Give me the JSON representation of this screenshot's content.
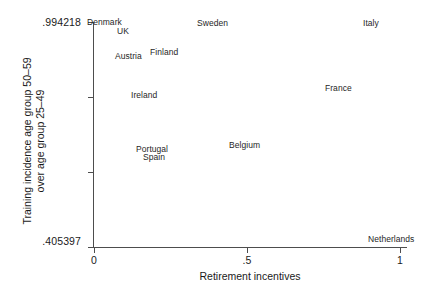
{
  "chart_data": {
    "type": "scatter",
    "title": "",
    "xlabel": "Retirement incentives",
    "ylabel_lines": [
      "Training incidence age group 50–59",
      "over age group 25–49"
    ],
    "xlim": [
      0,
      1
    ],
    "ylim": [
      0.405397,
      0.994218
    ],
    "xticks": [
      "0",
      ".5",
      "1"
    ],
    "xtick_values": [
      0,
      0.5,
      1
    ],
    "yticks": [
      ".994218",
      ".405397"
    ],
    "ytick_values": [
      0.994218,
      0.405397
    ],
    "grid": false,
    "legend": "none",
    "marker_style": "text-label-only",
    "points": [
      {
        "label": "Denmark",
        "x": 0.0,
        "y": 0.994,
        "px": 87,
        "py": 18
      },
      {
        "label": "UK",
        "x": 0.08,
        "y": 0.969,
        "px": 117,
        "py": 27
      },
      {
        "label": "Sweden",
        "x": 0.36,
        "y": 0.991,
        "px": 197,
        "py": 19
      },
      {
        "label": "Italy",
        "x": 0.88,
        "y": 0.991,
        "px": 363,
        "py": 19
      },
      {
        "label": "Austria",
        "x": 0.08,
        "y": 0.901,
        "px": 115,
        "py": 52
      },
      {
        "label": "Finland",
        "x": 0.19,
        "y": 0.912,
        "px": 150,
        "py": 48
      },
      {
        "label": "Ireland",
        "x": 0.13,
        "y": 0.796,
        "px": 131,
        "py": 91
      },
      {
        "label": "France",
        "x": 0.76,
        "y": 0.815,
        "px": 325,
        "py": 84
      },
      {
        "label": "Belgium",
        "x": 0.44,
        "y": 0.661,
        "px": 229,
        "py": 141
      },
      {
        "label": "Portugal",
        "x": 0.14,
        "y": 0.651,
        "px": 136,
        "py": 145
      },
      {
        "label": "Spain",
        "x": 0.16,
        "y": 0.629,
        "px": 143,
        "py": 153
      },
      {
        "label": "Netherlands",
        "x": 0.9,
        "y": 0.41,
        "px": 368,
        "py": 235
      }
    ]
  },
  "axes": {
    "y_tick_label_top": ".994218",
    "y_tick_label_bottom": ".405397",
    "y_title_line1": "Training incidence age group 50–59",
    "y_title_line2": "over age group 25–49",
    "x_title": "Retirement incentives",
    "x_tick_0": "0",
    "x_tick_half": ".5",
    "x_tick_one": "1"
  },
  "colors": {
    "axis": "#4d4d4d",
    "text": "#1a1a1a",
    "point_label": "#262626",
    "background": "#ffffff"
  }
}
